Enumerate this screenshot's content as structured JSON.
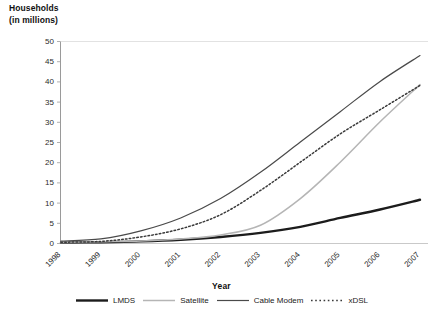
{
  "chart_data": {
    "type": "line",
    "title": "",
    "ylabel": "Households\n(in millions)",
    "xlabel": "Year",
    "categories": [
      "1998",
      "1999",
      "2000",
      "2001",
      "2002",
      "2003",
      "2004",
      "2005",
      "2006",
      "2007"
    ],
    "ylim": [
      0,
      50
    ],
    "yticks": [
      0,
      5,
      10,
      15,
      20,
      25,
      30,
      35,
      40,
      45,
      50
    ],
    "grid": false,
    "legend_position": "bottom",
    "series": [
      {
        "name": "LMDS",
        "style": "solid-thick",
        "color": "#1c1c1c",
        "values": [
          0.1,
          0.2,
          0.4,
          0.8,
          1.5,
          2.5,
          4.0,
          6.2,
          8.3,
          10.7
        ]
      },
      {
        "name": "Satellite",
        "style": "solid-thin",
        "color": "#b5b5b5",
        "values": [
          0.1,
          0.3,
          0.5,
          1.0,
          2.0,
          4.4,
          11.0,
          20.0,
          30.0,
          39.2
        ]
      },
      {
        "name": "Cable Modem",
        "style": "solid-medium",
        "color": "#4a4a4a",
        "values": [
          0.5,
          1.0,
          3.0,
          6.2,
          11.0,
          17.5,
          25.0,
          32.5,
          40.0,
          46.4
        ]
      },
      {
        "name": "xDSL",
        "style": "dotted",
        "color": "#3a3a3a",
        "values": [
          0.2,
          0.4,
          1.5,
          3.5,
          7.0,
          13.0,
          20.0,
          27.0,
          33.0,
          39.0
        ]
      }
    ]
  },
  "axis": {
    "y_title": "Households\n(in millions)",
    "x_title": "Year"
  },
  "legend": {
    "items": [
      {
        "label": "LMDS",
        "icon": "line-swatch-thick-black"
      },
      {
        "label": "Satellite",
        "icon": "line-swatch-light-gray"
      },
      {
        "label": "Cable Modem",
        "icon": "line-swatch-dark-gray"
      },
      {
        "label": "xDSL",
        "icon": "line-swatch-dotted"
      }
    ]
  }
}
